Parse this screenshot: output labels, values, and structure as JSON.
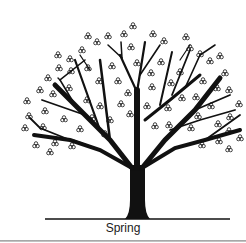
{
  "figure": {
    "caption": "Spring",
    "colors": {
      "ink": "#111111",
      "background": "#ffffff",
      "border": "#9a9a9a"
    }
  }
}
